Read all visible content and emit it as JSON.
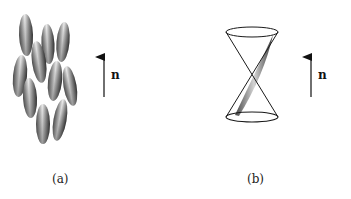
{
  "figure": {
    "panels": [
      {
        "id": "a",
        "caption": "(a)",
        "description": "Aligned elongated molecules (nematic order)",
        "director_label": "n",
        "ellipsoids": [
          {
            "cx": 26,
            "cy": 35,
            "rx": 7,
            "ry": 21,
            "rot": -2
          },
          {
            "cx": 48,
            "cy": 44,
            "rx": 6.5,
            "ry": 20,
            "rot": -3
          },
          {
            "cx": 63,
            "cy": 42,
            "rx": 6.5,
            "ry": 20,
            "rot": 5
          },
          {
            "cx": 39,
            "cy": 62,
            "rx": 7,
            "ry": 21,
            "rot": -8
          },
          {
            "cx": 20,
            "cy": 76,
            "rx": 7,
            "ry": 21,
            "rot": 5
          },
          {
            "cx": 55,
            "cy": 81,
            "rx": 7,
            "ry": 20,
            "rot": 6
          },
          {
            "cx": 70,
            "cy": 86,
            "rx": 6.5,
            "ry": 20,
            "rot": -10
          },
          {
            "cx": 30,
            "cy": 98,
            "rx": 7,
            "ry": 20,
            "rot": -3
          },
          {
            "cx": 43,
            "cy": 124,
            "rx": 7,
            "ry": 20,
            "rot": 0
          },
          {
            "cx": 60,
            "cy": 120,
            "rx": 6.5,
            "ry": 21,
            "rot": 10
          }
        ],
        "arrow": {
          "x": 104,
          "y1": 97,
          "y2": 55
        },
        "label_pos": {
          "x": 111,
          "y": 68
        }
      },
      {
        "id": "b",
        "caption": "(b)",
        "description": "Molecule precessing on a double cone around the director",
        "director_label": "n",
        "cone": {
          "cx": 252,
          "top_y": 32,
          "bottom_y": 117,
          "rx": 26,
          "ry": 5,
          "apex_y": 75
        },
        "arrow": {
          "x": 311,
          "y1": 97,
          "y2": 55
        },
        "label_pos": {
          "x": 318,
          "y": 68
        }
      }
    ],
    "caption_positions": {
      "a": {
        "x": 52,
        "y": 172
      },
      "b": {
        "x": 247,
        "y": 172
      }
    },
    "colors": {
      "ink": "#1a1a1a",
      "shade_light": "#e8e8e8",
      "shade_dark": "#4a4a4a"
    }
  }
}
